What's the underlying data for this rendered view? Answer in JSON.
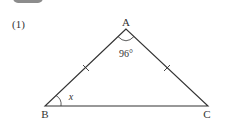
{
  "problem": {
    "number": "(1)"
  },
  "figure": {
    "type": "isosceles-triangle",
    "vertices": {
      "A": {
        "label": "A",
        "x": 126,
        "y": 29
      },
      "B": {
        "label": "B",
        "x": 45,
        "y": 106
      },
      "C": {
        "label": "C",
        "x": 208,
        "y": 106
      }
    },
    "angle_A_label": "96°",
    "angle_B_label": "x",
    "equal_sides": [
      "AB",
      "AC"
    ],
    "line_color": "#333333"
  }
}
